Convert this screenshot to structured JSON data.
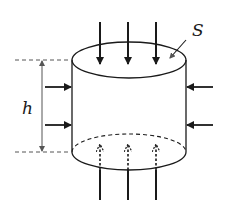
{
  "figure": {
    "labels": {
      "height": "h",
      "surface": "S"
    },
    "colors": {
      "stroke": "#1a1a1a",
      "dim": "#555555",
      "background": "#ffffff"
    },
    "cylinder": {
      "cx": 129,
      "top_cy": 60,
      "bottom_cy": 152,
      "rx": 57,
      "ry": 18
    },
    "top_arrows_x": [
      100,
      128,
      156
    ],
    "bottom_arrows_x": [
      100,
      128,
      156
    ],
    "side_arrows_y": [
      87,
      125
    ]
  }
}
